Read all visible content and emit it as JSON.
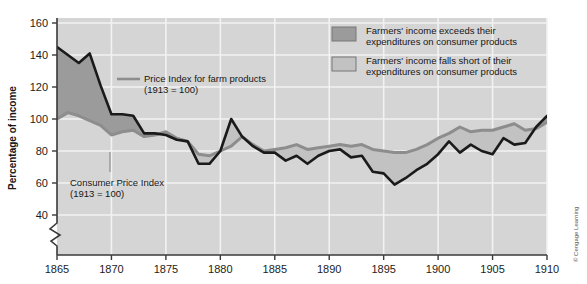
{
  "figure": {
    "credit": "© Cengage Learning",
    "background": "#ffffff",
    "plot_bg": "#d5d5d5",
    "grid_color": "#f2f2f2",
    "axis_color": "#3a3a3a"
  },
  "axes": {
    "ylabel": "Percentage of income",
    "yticks": [
      "40",
      "60",
      "80",
      "100",
      "120",
      "140",
      "160"
    ],
    "xticks": [
      "1865",
      "1870",
      "1875",
      "1880",
      "1885",
      "1890",
      "1895",
      "1900",
      "1905",
      "1910"
    ],
    "axis_break": "zigzag"
  },
  "legend": {
    "items": [
      {
        "swatch_color": "#9b9b9b",
        "line1": "Farmers' income exceeds their",
        "line2": "expenditures on consumer products"
      },
      {
        "swatch_color": "#c2c2c2",
        "line1": "Farmers' income falls short of their",
        "line2": "expenditures on consumer products"
      }
    ]
  },
  "annotations": [
    {
      "name": "farm-price-index",
      "line1": "Price Index for farm products",
      "line2": "(1913 = 100)",
      "swatch_color": "#8d8d8d"
    },
    {
      "name": "consumer-price-index",
      "line1": "Consumer Price Index",
      "line2": "(1913 = 100)"
    }
  ],
  "chart_data": {
    "type": "line",
    "title": "",
    "subtitle": "",
    "xlabel": "",
    "ylabel": "Percentage of income",
    "xlim": [
      1865,
      1910
    ],
    "ylim": [
      30,
      160
    ],
    "grid": true,
    "legend_position": "top-right",
    "fill_between": {
      "above_color": "#9b9b9b",
      "above_meaning": "Farmers' income exceeds their expenditures on consumer products",
      "below_color": "#c2c2c2",
      "below_meaning": "Farmers' income falls short of their expenditures on consumer products"
    },
    "x": [
      1865,
      1866,
      1867,
      1868,
      1869,
      1870,
      1871,
      1872,
      1873,
      1874,
      1875,
      1876,
      1877,
      1878,
      1879,
      1880,
      1881,
      1882,
      1883,
      1884,
      1885,
      1886,
      1887,
      1888,
      1889,
      1890,
      1891,
      1892,
      1893,
      1894,
      1895,
      1896,
      1897,
      1898,
      1899,
      1900,
      1901,
      1902,
      1903,
      1904,
      1905,
      1906,
      1907,
      1908,
      1909,
      1910
    ],
    "series": [
      {
        "name": "Price Index for farm products (1913 = 100)",
        "color": "#1a1a1a",
        "style": "solid-dark",
        "values": [
          145,
          140,
          135,
          141,
          121,
          103,
          103,
          102,
          91,
          91,
          90,
          87,
          86,
          72,
          72,
          80,
          100,
          89,
          83,
          79,
          79,
          74,
          77,
          72,
          77,
          80,
          81,
          76,
          77,
          67,
          66,
          59,
          63,
          68,
          72,
          78,
          86,
          79,
          84,
          80,
          78,
          88,
          84,
          85,
          95,
          102
        ]
      },
      {
        "name": "Consumer Price Index (1913 = 100)",
        "color": "#8d8d8d",
        "style": "solid-gray",
        "values": [
          100,
          104,
          102,
          99,
          96,
          90,
          92,
          93,
          89,
          90,
          92,
          88,
          86,
          78,
          77,
          80,
          83,
          89,
          84,
          80,
          81,
          82,
          84,
          81,
          82,
          83,
          84,
          83,
          84,
          81,
          80,
          79,
          79,
          81,
          84,
          88,
          91,
          95,
          92,
          93,
          93,
          95,
          97,
          93,
          94,
          98
        ]
      }
    ]
  }
}
